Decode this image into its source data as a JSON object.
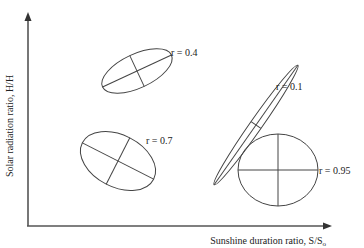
{
  "figure": {
    "ylabel": "Solar  radiation ratio, H/H",
    "xlabel": "Sunshine duration ratio, S/S",
    "xlabel_subscript": "o",
    "colors": {
      "ink": "#444444",
      "background": "#ffffff"
    }
  },
  "ellipses": [
    {
      "id": "r04",
      "label": "r = 0.4",
      "r": 0.4
    },
    {
      "id": "r01",
      "label": "r = 0.1",
      "r": 0.1
    },
    {
      "id": "r07",
      "label": "r = 0.7",
      "r": 0.7
    },
    {
      "id": "r095",
      "label": "r = 0.95",
      "r": 0.95
    }
  ]
}
